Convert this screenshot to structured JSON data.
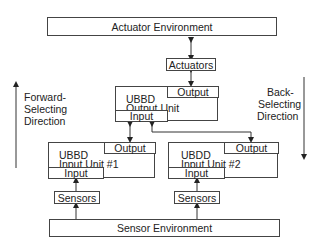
{
  "diagram": {
    "actuator_environment": "Actuator Environment",
    "actuators": "Actuators",
    "output_unit": {
      "title_line1": "UBBD",
      "title_line2": "Output Unit",
      "output_port": "Output",
      "input_port": "Input"
    },
    "input_unit_1": {
      "title_line1": "UBBD",
      "title_line2": "Input Unit #1",
      "output_port": "Output",
      "input_port": "Input"
    },
    "input_unit_2": {
      "title_line1": "UBDD",
      "title_line2": "Input Unit #2",
      "output_port": "Output",
      "input_port": "Input"
    },
    "sensors_1": "Sensors",
    "sensors_2": "Sensors",
    "sensor_environment": "Sensor Environment",
    "forward_direction": {
      "line1": "Forward-",
      "line2": "Selecting",
      "line3": "Direction"
    },
    "back_direction": {
      "line1": "Back-",
      "line2": "Selecting",
      "line3": "Direction"
    },
    "colors": {
      "line": "#444444",
      "text": "#222222",
      "background": "#ffffff"
    }
  }
}
